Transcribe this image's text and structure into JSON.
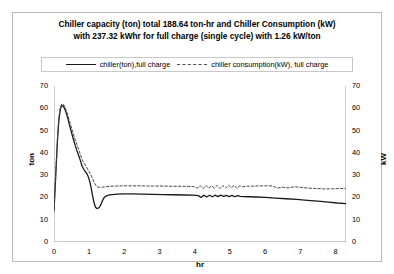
{
  "chart_data": {
    "type": "line",
    "title": "Chiller capacity (ton) total  188.64 ton-hr and Chiller Consumption (kW) with 237.32 kWhr for full charge (single cycle) with 1.26 kW/ton",
    "title_line1": "Chiller capacity (ton) total  188.64 ton-hr and Chiller Consumption (kW)",
    "title_line2": "with 237.32 kWhr for full charge (single cycle) with 1.26 kW/ton",
    "xlabel": "hr",
    "ylabel": "ton",
    "ylabel_right": "kW",
    "xlim": [
      0,
      8.3
    ],
    "ylim": [
      0,
      70
    ],
    "ylim_right": [
      0,
      70
    ],
    "xticks": [
      0,
      1,
      2,
      3,
      4,
      5,
      6,
      7,
      8
    ],
    "yticks": [
      0,
      10,
      20,
      30,
      40,
      50,
      60,
      70
    ],
    "yticks_right": [
      0,
      10,
      20,
      30,
      40,
      50,
      60,
      70
    ],
    "grid": false,
    "legend_position": "top",
    "series": [
      {
        "name": "chiller(ton),full charge",
        "style": "solid",
        "color": "#1a1a1a",
        "axis": "left",
        "x": [
          0.0,
          0.05,
          0.1,
          0.14,
          0.18,
          0.22,
          0.26,
          0.3,
          0.35,
          0.4,
          0.45,
          0.5,
          0.55,
          0.6,
          0.65,
          0.7,
          0.75,
          0.8,
          0.85,
          0.9,
          0.95,
          0.98,
          1.02,
          1.06,
          1.1,
          1.14,
          1.18,
          1.22,
          1.26,
          1.3,
          1.34,
          1.38,
          1.42,
          1.48,
          1.55,
          1.65,
          1.8,
          2.0,
          2.2,
          2.5,
          2.8,
          3.1,
          3.4,
          3.7,
          3.95,
          4.1,
          4.18,
          4.26,
          4.34,
          4.42,
          4.5,
          4.58,
          4.66,
          4.74,
          4.82,
          4.9,
          4.98,
          5.06,
          5.14,
          5.22,
          5.3,
          5.4,
          5.55,
          5.75,
          6.0,
          6.3,
          6.6,
          6.9,
          7.2,
          7.5,
          7.8,
          8.05,
          8.3
        ],
        "y": [
          14.0,
          30.0,
          46.0,
          55.0,
          59.5,
          61.3,
          61.0,
          60.0,
          57.8,
          55.0,
          52.0,
          49.0,
          46.2,
          43.5,
          41.0,
          38.8,
          36.5,
          34.0,
          32.5,
          31.5,
          30.2,
          29.0,
          27.0,
          24.0,
          20.5,
          17.5,
          15.6,
          15.0,
          15.2,
          15.8,
          17.0,
          18.6,
          19.8,
          20.6,
          21.0,
          21.3,
          21.5,
          21.6,
          21.6,
          21.5,
          21.4,
          21.3,
          21.2,
          21.1,
          21.0,
          20.8,
          20.0,
          21.0,
          20.2,
          21.0,
          20.3,
          21.0,
          20.4,
          21.0,
          20.5,
          20.9,
          20.4,
          20.9,
          20.3,
          20.8,
          20.5,
          20.4,
          20.3,
          20.2,
          20.0,
          19.7,
          19.4,
          19.1,
          18.7,
          18.3,
          17.9,
          17.5,
          17.2
        ]
      },
      {
        "name": "chiller consumption(kW), full charge",
        "style": "dashed",
        "color": "#4a4a4a",
        "axis": "right",
        "x": [
          0.0,
          0.05,
          0.1,
          0.14,
          0.18,
          0.22,
          0.26,
          0.3,
          0.35,
          0.4,
          0.45,
          0.5,
          0.55,
          0.6,
          0.65,
          0.7,
          0.75,
          0.8,
          0.85,
          0.9,
          0.95,
          1.0,
          1.05,
          1.1,
          1.15,
          1.2,
          1.25,
          1.3,
          1.38,
          1.48,
          1.6,
          1.75,
          1.95,
          2.2,
          2.5,
          2.8,
          3.1,
          3.4,
          3.7,
          3.95,
          4.08,
          4.16,
          4.24,
          4.32,
          4.4,
          4.48,
          4.56,
          4.64,
          4.72,
          4.8,
          4.88,
          4.96,
          5.04,
          5.12,
          5.2,
          5.28,
          5.36,
          5.5,
          5.7,
          5.95,
          6.2,
          6.35,
          6.5,
          6.65,
          6.85,
          7.0,
          7.2,
          7.45,
          7.7,
          7.95,
          8.15,
          8.3
        ],
        "y": [
          14.5,
          31.0,
          47.0,
          56.0,
          60.5,
          62.0,
          61.8,
          61.0,
          59.0,
          56.5,
          53.8,
          51.0,
          48.5,
          46.0,
          43.8,
          41.5,
          39.2,
          37.0,
          35.5,
          34.2,
          32.8,
          31.5,
          30.0,
          28.3,
          26.5,
          25.2,
          24.6,
          24.5,
          24.6,
          24.8,
          25.0,
          25.1,
          25.2,
          25.2,
          25.2,
          25.1,
          25.1,
          25.0,
          25.0,
          24.9,
          24.2,
          25.3,
          24.0,
          25.4,
          24.1,
          25.3,
          24.2,
          25.4,
          24.0,
          25.3,
          24.2,
          25.5,
          24.3,
          25.4,
          24.1,
          25.2,
          24.8,
          25.0,
          25.1,
          25.2,
          25.2,
          24.2,
          24.6,
          24.3,
          24.8,
          24.5,
          24.2,
          24.0,
          23.8,
          23.9,
          24.0,
          24.1
        ]
      }
    ]
  },
  "legend": {
    "entries": [
      {
        "label": "chiller(ton),full charge"
      },
      {
        "label": "chiller consumption(kW), full charge"
      }
    ]
  }
}
